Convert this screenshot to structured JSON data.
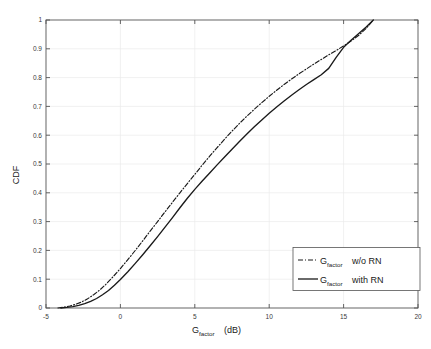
{
  "figure": {
    "background_color": "#ffffff",
    "axes_color": "#555555",
    "grid_color": "#ebebeb",
    "line_color": "#1a1a1a"
  },
  "axis": {
    "xlabel_main": "G",
    "xlabel_sub": "factor",
    "xlabel_unit": "(dB)",
    "ylabel": "CDF",
    "xticks": [
      "-5",
      "0",
      "5",
      "10",
      "15",
      "20"
    ],
    "yticks": [
      "0",
      "0.1",
      "0.2",
      "0.3",
      "0.4",
      "0.5",
      "0.6",
      "0.7",
      "0.8",
      "0.9",
      "1"
    ]
  },
  "legend": {
    "items": [
      {
        "style": "dashdot",
        "main": "G",
        "sub": "factor",
        "tail": "w/o RN"
      },
      {
        "style": "solid",
        "main": "G",
        "sub": "factor",
        "tail": "with RN"
      }
    ]
  },
  "chart_data": {
    "type": "line",
    "title": "",
    "xlabel": "G_factor (dB)",
    "ylabel": "CDF",
    "xlim": [
      -5,
      20
    ],
    "ylim": [
      0,
      1
    ],
    "xticks": [
      -5,
      0,
      5,
      10,
      15,
      20
    ],
    "yticks": [
      0,
      0.1,
      0.2,
      0.3,
      0.4,
      0.5,
      0.6,
      0.7,
      0.8,
      0.9,
      1
    ],
    "grid": true,
    "legend_position": "lower right",
    "series": [
      {
        "name": "G_factor w/o RN",
        "linestyle": "dashdot",
        "color": "#1a1a1a",
        "x": [
          -4.2,
          -3.8,
          -3.4,
          -3.0,
          -2.6,
          -2.2,
          -1.8,
          -1.4,
          -1.0,
          -0.5,
          0.0,
          0.5,
          1.0,
          1.5,
          2.0,
          2.5,
          3.0,
          3.5,
          4.0,
          4.5,
          5.0,
          5.5,
          6.0,
          6.5,
          7.0,
          7.5,
          8.0,
          8.5,
          9.0,
          9.5,
          10.0,
          10.5,
          11.0,
          11.5,
          12.0,
          12.5,
          13.0,
          13.5,
          14.0,
          14.5,
          15.0,
          15.5,
          16.0,
          16.5,
          17.0
        ],
        "y": [
          0.0,
          0.003,
          0.007,
          0.013,
          0.021,
          0.032,
          0.046,
          0.062,
          0.081,
          0.108,
          0.137,
          0.168,
          0.2,
          0.233,
          0.267,
          0.3,
          0.334,
          0.367,
          0.4,
          0.432,
          0.464,
          0.496,
          0.527,
          0.557,
          0.586,
          0.614,
          0.641,
          0.666,
          0.69,
          0.713,
          0.735,
          0.756,
          0.776,
          0.795,
          0.813,
          0.83,
          0.847,
          0.863,
          0.879,
          0.894,
          0.91,
          0.927,
          0.946,
          0.97,
          1.0
        ]
      },
      {
        "name": "G_factor with RN",
        "linestyle": "solid",
        "color": "#1a1a1a",
        "x": [
          -4.0,
          -3.6,
          -3.2,
          -2.8,
          -2.4,
          -2.0,
          -1.6,
          -1.2,
          -0.8,
          -0.4,
          0.0,
          0.5,
          1.0,
          1.5,
          2.0,
          2.5,
          3.0,
          3.5,
          4.0,
          4.5,
          5.0,
          5.5,
          6.0,
          6.5,
          7.0,
          7.5,
          8.0,
          8.5,
          9.0,
          9.5,
          10.0,
          10.5,
          11.0,
          11.5,
          12.0,
          12.5,
          13.0,
          13.5,
          14.0,
          14.5,
          15.0,
          15.5,
          16.0,
          16.5,
          17.0
        ],
        "y": [
          0.0,
          0.002,
          0.005,
          0.009,
          0.015,
          0.023,
          0.033,
          0.046,
          0.061,
          0.079,
          0.099,
          0.126,
          0.155,
          0.185,
          0.216,
          0.248,
          0.281,
          0.314,
          0.348,
          0.381,
          0.412,
          0.441,
          0.469,
          0.497,
          0.524,
          0.551,
          0.578,
          0.604,
          0.629,
          0.653,
          0.676,
          0.698,
          0.719,
          0.739,
          0.758,
          0.776,
          0.793,
          0.81,
          0.832,
          0.87,
          0.905,
          0.93,
          0.952,
          0.975,
          1.0
        ]
      }
    ]
  }
}
